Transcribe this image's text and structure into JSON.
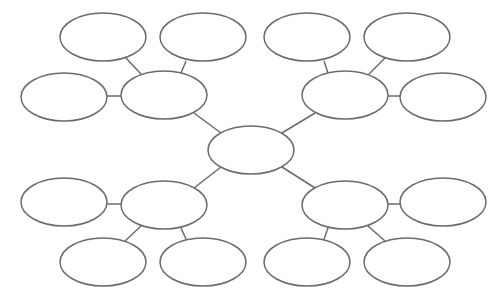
{
  "diagram": {
    "type": "bubble-map",
    "stroke_color": "#6b6b6b",
    "fill_color": "#ffffff",
    "background": "#ffffff",
    "rx": 43,
    "ry": 24,
    "nodes": [
      {
        "id": "center",
        "cx": 251,
        "cy": 150,
        "label": ""
      },
      {
        "id": "hub-top-left",
        "cx": 164,
        "cy": 95,
        "label": ""
      },
      {
        "id": "hub-top-right",
        "cx": 345,
        "cy": 95,
        "label": ""
      },
      {
        "id": "hub-bottom-left",
        "cx": 164,
        "cy": 205,
        "label": ""
      },
      {
        "id": "hub-bottom-right",
        "cx": 345,
        "cy": 205,
        "label": ""
      },
      {
        "id": "tl-top-a",
        "cx": 103,
        "cy": 37,
        "label": ""
      },
      {
        "id": "tl-top-b",
        "cx": 203,
        "cy": 37,
        "label": ""
      },
      {
        "id": "tl-side",
        "cx": 64,
        "cy": 97,
        "label": ""
      },
      {
        "id": "tr-top-a",
        "cx": 307,
        "cy": 37,
        "label": ""
      },
      {
        "id": "tr-top-b",
        "cx": 407,
        "cy": 37,
        "label": ""
      },
      {
        "id": "tr-side",
        "cx": 443,
        "cy": 97,
        "label": ""
      },
      {
        "id": "bl-side",
        "cx": 64,
        "cy": 202,
        "label": ""
      },
      {
        "id": "bl-bottom-a",
        "cx": 103,
        "cy": 262,
        "label": ""
      },
      {
        "id": "bl-bottom-b",
        "cx": 203,
        "cy": 262,
        "label": ""
      },
      {
        "id": "br-side",
        "cx": 443,
        "cy": 202,
        "label": ""
      },
      {
        "id": "br-bottom-a",
        "cx": 307,
        "cy": 262,
        "label": ""
      },
      {
        "id": "br-bottom-b",
        "cx": 407,
        "cy": 262,
        "label": ""
      }
    ],
    "edges": [
      {
        "x1": 221,
        "y1": 133,
        "x2": 194,
        "y2": 113
      },
      {
        "x1": 282,
        "y1": 133,
        "x2": 315,
        "y2": 113
      },
      {
        "x1": 221,
        "y1": 167,
        "x2": 194,
        "y2": 188
      },
      {
        "x1": 282,
        "y1": 167,
        "x2": 315,
        "y2": 188
      },
      {
        "x1": 125,
        "y1": 57,
        "x2": 141,
        "y2": 74
      },
      {
        "x1": 186,
        "y1": 61,
        "x2": 181,
        "y2": 73
      },
      {
        "x1": 107,
        "y1": 96,
        "x2": 121,
        "y2": 96
      },
      {
        "x1": 324,
        "y1": 61,
        "x2": 328,
        "y2": 73
      },
      {
        "x1": 385,
        "y1": 58,
        "x2": 368,
        "y2": 75
      },
      {
        "x1": 388,
        "y1": 96,
        "x2": 401,
        "y2": 96
      },
      {
        "x1": 107,
        "y1": 204,
        "x2": 121,
        "y2": 204
      },
      {
        "x1": 141,
        "y1": 226,
        "x2": 125,
        "y2": 241
      },
      {
        "x1": 181,
        "y1": 228,
        "x2": 186,
        "y2": 239
      },
      {
        "x1": 388,
        "y1": 204,
        "x2": 401,
        "y2": 204
      },
      {
        "x1": 328,
        "y1": 228,
        "x2": 324,
        "y2": 239
      },
      {
        "x1": 368,
        "y1": 226,
        "x2": 385,
        "y2": 241
      }
    ]
  }
}
